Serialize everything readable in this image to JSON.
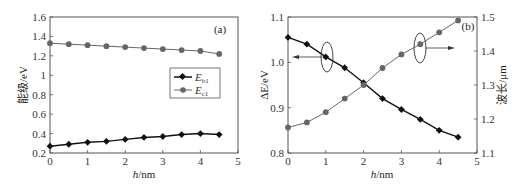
{
  "chart_data": [
    {
      "type": "line",
      "panel_label": "(a)",
      "xlabel_italic": "h",
      "xlabel_unit": "/nm",
      "ylabel": "能级/eV",
      "xlim": [
        0,
        5
      ],
      "ylim": [
        0.2,
        1.6
      ],
      "x_ticks": [
        "0",
        "1",
        "2",
        "3",
        "4",
        "5"
      ],
      "y_ticks": [
        "0.2",
        "0.4",
        "0.6",
        "0.8",
        "1",
        "1.2",
        "1.4",
        "1.6"
      ],
      "grid": false,
      "legend_position": "center-right",
      "x": [
        0,
        0.5,
        1,
        1.5,
        2,
        2.5,
        3,
        3.5,
        4,
        4.5
      ],
      "series": [
        {
          "name": "E_b1",
          "label_main": "E",
          "label_sub": "b1",
          "marker": "diamond",
          "color": "#111111",
          "values": [
            0.27,
            0.29,
            0.31,
            0.32,
            0.34,
            0.36,
            0.37,
            0.39,
            0.4,
            0.39
          ]
        },
        {
          "name": "E_c1",
          "label_main": "E",
          "label_sub": "c1",
          "marker": "circle",
          "color": "#666666",
          "values": [
            1.33,
            1.32,
            1.31,
            1.3,
            1.29,
            1.28,
            1.27,
            1.26,
            1.25,
            1.22
          ]
        }
      ]
    },
    {
      "type": "line",
      "panel_label": "(b)",
      "xlabel_italic": "h",
      "xlabel_unit": "/nm",
      "ylabel": "ΔE/eV",
      "ylabel_right": "波长/μm",
      "xlim": [
        0,
        5
      ],
      "ylim": [
        0.8,
        1.1
      ],
      "ylim_right": [
        1.1,
        1.5
      ],
      "x_ticks": [
        "0",
        "1",
        "2",
        "3",
        "4",
        "5"
      ],
      "y_ticks": [
        "0.8",
        "0.9",
        "1.0",
        "1.1"
      ],
      "y_ticks_right": [
        "1.1",
        "1.2",
        "1.3",
        "1.4",
        "1.5"
      ],
      "grid": false,
      "x": [
        0,
        0.5,
        1,
        1.5,
        2,
        2.5,
        3,
        3.5,
        4,
        4.5
      ],
      "series": [
        {
          "name": "ΔE",
          "axis": "left",
          "marker": "diamond",
          "color": "#111111",
          "values": [
            1.055,
            1.04,
            1.012,
            0.988,
            0.955,
            0.92,
            0.896,
            0.874,
            0.85,
            0.835
          ]
        },
        {
          "name": "波长",
          "axis": "right",
          "marker": "circle",
          "color": "#666666",
          "values": [
            1.175,
            1.19,
            1.22,
            1.26,
            1.3,
            1.35,
            1.39,
            1.42,
            1.455,
            1.49
          ]
        }
      ]
    }
  ]
}
